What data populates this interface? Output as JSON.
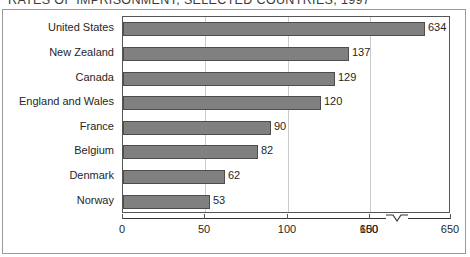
{
  "chart_data": {
    "type": "bar",
    "orientation": "horizontal",
    "title": "RATES OF IMPRISONMENT, SELECTED COUNTRIES, 1997",
    "xlabel": "",
    "ylabel": "",
    "categories": [
      "United States",
      "New Zealand",
      "Canada",
      "England and Wales",
      "France",
      "Belgium",
      "Denmark",
      "Norway"
    ],
    "values": [
      634,
      137,
      129,
      120,
      90,
      82,
      62,
      53
    ],
    "value_labels": [
      "634",
      "137",
      "129",
      "120",
      "90",
      "82",
      "62",
      "53"
    ],
    "xticks": [
      0,
      50,
      100,
      150,
      600,
      650
    ],
    "xtick_labels": [
      "0",
      "50",
      "100",
      "150",
      "600",
      "650"
    ],
    "xlim": [
      0,
      650
    ],
    "axis_break": {
      "present": true,
      "between": [
        150,
        600
      ],
      "symbol": "v-notch"
    },
    "grid": "vertical",
    "legend": "none",
    "bar_color": "#808080",
    "bar_edge_color": "#4d4d4d",
    "grid_color": "#cccccc",
    "axis_color": "#333333",
    "background_color": "#ffffff"
  }
}
